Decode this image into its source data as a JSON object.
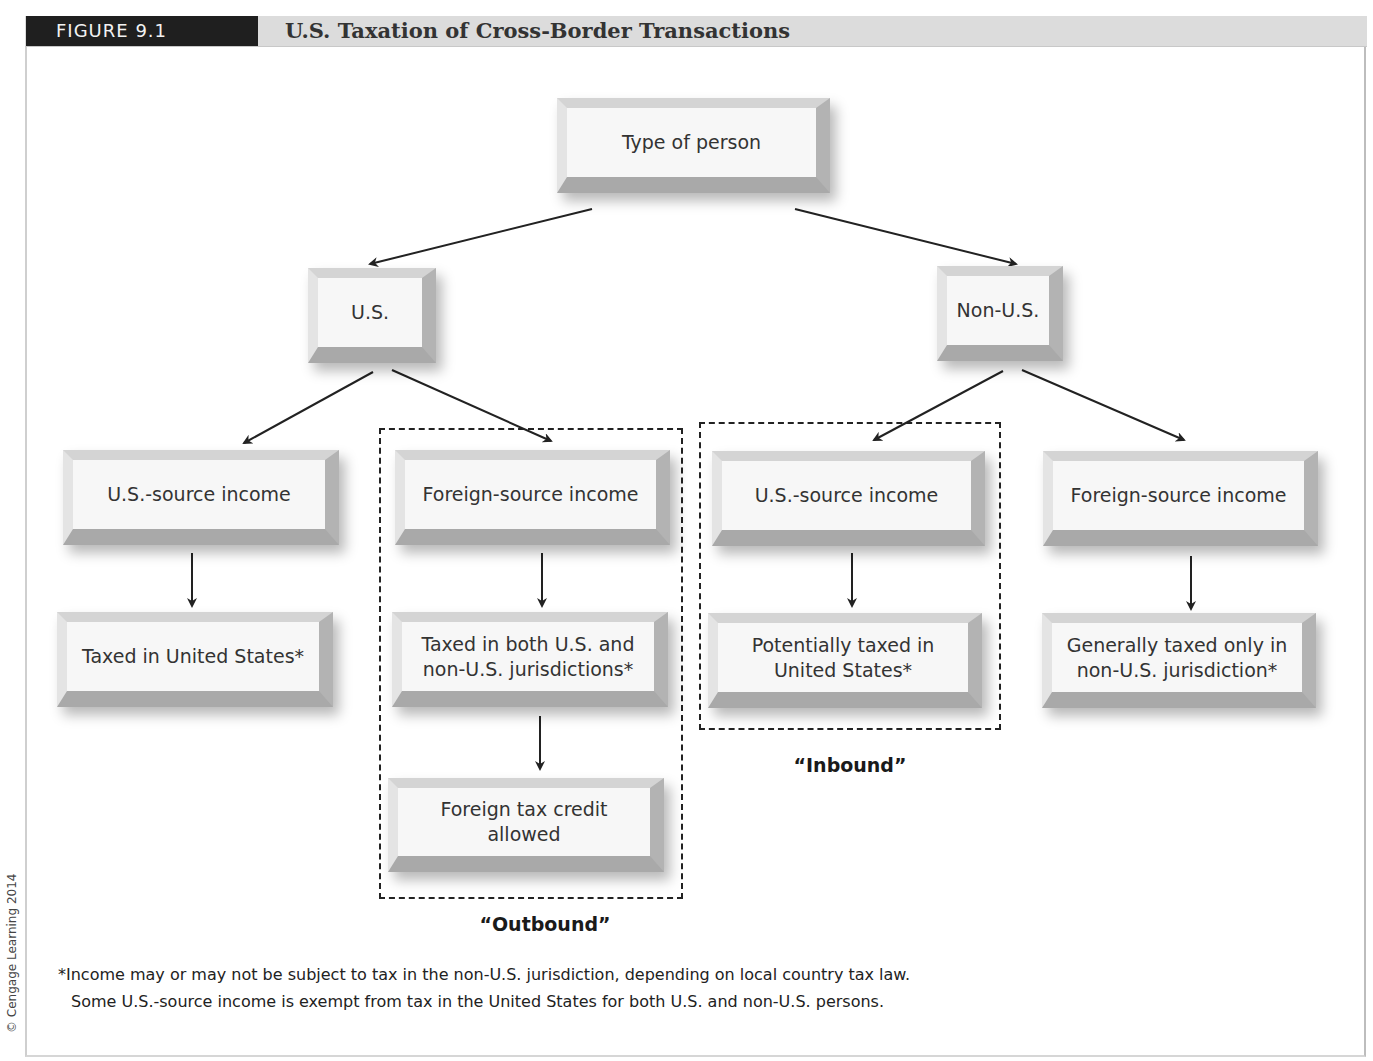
{
  "figure": {
    "label": "FIGURE 9.1",
    "title": "U.S. Taxation of Cross-Border Transactions"
  },
  "nodes": {
    "root": "Type of person",
    "us_person": "U.S.",
    "non_us_person": "Non-U.S.",
    "us_us_source": "U.S.-source income",
    "us_foreign_source": "Foreign-source income",
    "nonus_us_source": "U.S.-source income",
    "nonus_foreign_source": "Foreign-source income",
    "us_us_source_result": "Taxed in United States*",
    "us_foreign_source_result": "Taxed in both U.S. and non-U.S. jurisdictions*",
    "us_foreign_tax_credit": "Foreign tax credit allowed",
    "nonus_us_source_result": "Potentially taxed in United States*",
    "nonus_foreign_source_result": "Generally taxed only in non-U.S. jurisdiction*"
  },
  "groups": {
    "outbound": "“Outbound”",
    "inbound": "“Inbound”"
  },
  "footnote": {
    "line1": "*Income may or may not be subject to tax in the non-U.S. jurisdiction, depending on local country tax law.",
    "line2": "Some U.S.-source income is exempt from tax in the United States for both U.S. and non-U.S. persons."
  },
  "copyright": "© Cengage Learning 2014",
  "colors": {
    "label_bg": "#1f1f1f",
    "header_bg": "#dcdcdc",
    "box_face": "#f7f7f7",
    "arrow": "#222222"
  }
}
